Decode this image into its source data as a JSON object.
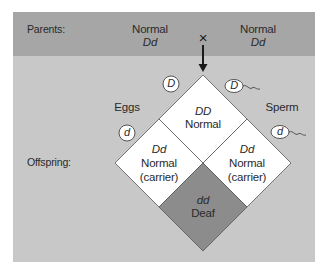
{
  "rows": {
    "parents_label": "Parents:",
    "offspring_label": "Offspring:"
  },
  "parents": {
    "left": {
      "phenotype": "Normal",
      "genotype": "Dd"
    },
    "right": {
      "phenotype": "Normal",
      "genotype": "Dd"
    },
    "cross_symbol": "×"
  },
  "gametes": {
    "eggs_label": "Eggs",
    "sperm_label": "Sperm",
    "eggs": [
      "D",
      "d"
    ],
    "sperm": [
      "D",
      "d"
    ]
  },
  "offspring": {
    "top": {
      "genotype": "DD",
      "phenotype": "Normal",
      "note": ""
    },
    "left": {
      "genotype": "Dd",
      "phenotype": "Normal",
      "note": "(carrier)"
    },
    "right": {
      "genotype": "Dd",
      "phenotype": "Normal",
      "note": "(carrier)"
    },
    "bottom": {
      "genotype": "dd",
      "phenotype": "Deaf",
      "note": ""
    }
  },
  "colors": {
    "header_band": "#a6a6a6",
    "panel": "#c8c8c8",
    "normal_cell": "#ffffff",
    "affected_cell": "#8c8c8c",
    "stroke": "#555555"
  }
}
